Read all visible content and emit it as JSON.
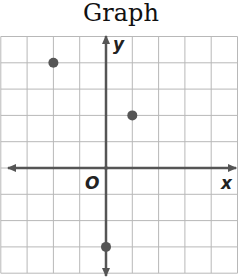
{
  "title": "Graph",
  "chart_data": {
    "type": "scatter",
    "title": "Graph",
    "xlabel": "x",
    "ylabel": "y",
    "origin_label": "O",
    "xlim": [
      -4,
      5
    ],
    "ylim": [
      -4,
      5
    ],
    "grid": true,
    "points": [
      {
        "x": -2,
        "y": 4
      },
      {
        "x": 1,
        "y": 2
      },
      {
        "x": 0,
        "y": -3
      }
    ]
  },
  "colors": {
    "grid": "#b8b8b8",
    "axis": "#555555",
    "point": "#555555"
  }
}
